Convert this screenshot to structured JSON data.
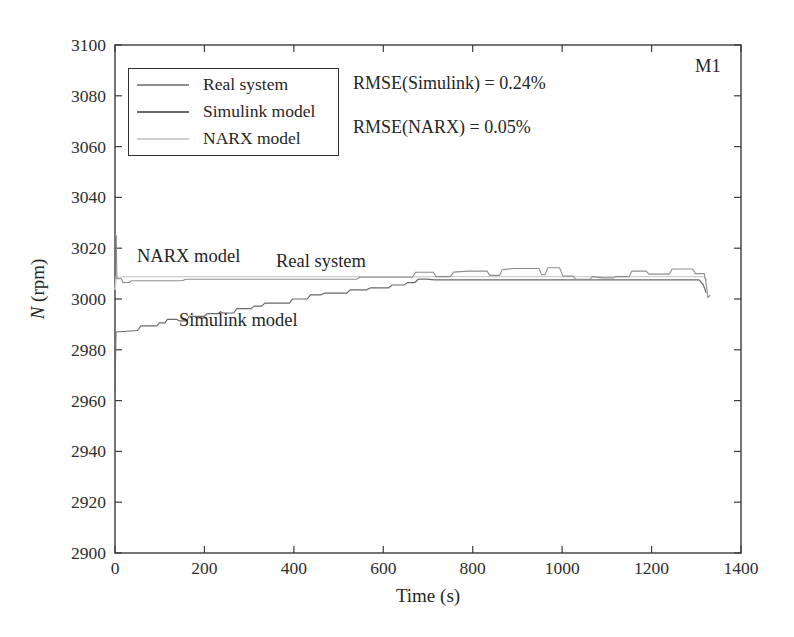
{
  "annotations": {
    "rmse_simulink": "RMSE(Simulink) = 0.24%",
    "rmse_narx": "RMSE(NARX) = 0.05%",
    "corner": "M1",
    "label_narx": "NARX model",
    "label_real": "Real system",
    "label_simulink": "Simulink model"
  },
  "chart_data": {
    "type": "line",
    "title": "",
    "xlabel": "Time (s)",
    "ylabel": "N (rpm)",
    "ylabel_var": "N",
    "ylabel_unit": " (rpm)",
    "xlim": [
      0,
      1400
    ],
    "ylim": [
      2900,
      3100
    ],
    "xticks": [
      0,
      200,
      400,
      600,
      800,
      1000,
      1200,
      1400
    ],
    "yticks": [
      2900,
      2920,
      2940,
      2960,
      2980,
      3000,
      3020,
      3040,
      3060,
      3080,
      3100
    ],
    "grid": false,
    "legend_position": "top-left-inside",
    "axis_color": "#3c3c3c",
    "tick_label_color": "#2e2e2e",
    "series": [
      {
        "name": "Real system",
        "color": "#8e8e8e",
        "width": 1.1,
        "points": [
          [
            0,
            3025
          ],
          [
            3,
            3025
          ],
          [
            4,
            3008
          ],
          [
            14,
            3008
          ],
          [
            18,
            3006.5
          ],
          [
            32,
            3006.5
          ],
          [
            36,
            3007.2
          ],
          [
            150,
            3007.2
          ],
          [
            158,
            3007.8
          ],
          [
            540,
            3007.8
          ],
          [
            548,
            3008.6
          ],
          [
            665,
            3008.6
          ],
          [
            672,
            3010.5
          ],
          [
            712,
            3010.5
          ],
          [
            718,
            3008.8
          ],
          [
            750,
            3008.8
          ],
          [
            757,
            3010.6
          ],
          [
            790,
            3011
          ],
          [
            832,
            3011
          ],
          [
            838,
            3009.3
          ],
          [
            860,
            3009.3
          ],
          [
            866,
            3011.5
          ],
          [
            890,
            3012
          ],
          [
            948,
            3012
          ],
          [
            954,
            3009.6
          ],
          [
            962,
            3009.6
          ],
          [
            968,
            3012.3
          ],
          [
            994,
            3012.3
          ],
          [
            1002,
            3009
          ],
          [
            1024,
            3009
          ],
          [
            1030,
            3007.8
          ],
          [
            1062,
            3007.8
          ],
          [
            1068,
            3008.8
          ],
          [
            1090,
            3008.3
          ],
          [
            1115,
            3008.3
          ],
          [
            1120,
            3008.8
          ],
          [
            1150,
            3008.8
          ],
          [
            1156,
            3011
          ],
          [
            1188,
            3011
          ],
          [
            1194,
            3009.8
          ],
          [
            1240,
            3009.8
          ],
          [
            1246,
            3011.8
          ],
          [
            1292,
            3011.8
          ],
          [
            1298,
            3010
          ],
          [
            1318,
            3010
          ],
          [
            1323,
            3005
          ],
          [
            1326,
            3000.5
          ],
          [
            1331,
            3001.5
          ]
        ]
      },
      {
        "name": "Simulink model",
        "color": "#6a6a6a",
        "width": 1.2,
        "points": [
          [
            0,
            2964
          ],
          [
            2,
            2987
          ],
          [
            50,
            2987.6
          ],
          [
            58,
            2989.4
          ],
          [
            94,
            2989.4
          ],
          [
            99,
            2990.6
          ],
          [
            112,
            2990.6
          ],
          [
            117,
            2992
          ],
          [
            138,
            2992
          ],
          [
            143,
            2991.4
          ],
          [
            160,
            2991.4
          ],
          [
            166,
            2993.2
          ],
          [
            200,
            2993.2
          ],
          [
            206,
            2994.2
          ],
          [
            230,
            2994.2
          ],
          [
            236,
            2995
          ],
          [
            242,
            2994.5
          ],
          [
            266,
            2994.5
          ],
          [
            272,
            2996.2
          ],
          [
            304,
            2996.2
          ],
          [
            311,
            2997.2
          ],
          [
            328,
            2997.2
          ],
          [
            335,
            2998.4
          ],
          [
            390,
            2998.4
          ],
          [
            397,
            3000
          ],
          [
            430,
            3000
          ],
          [
            437,
            3001.6
          ],
          [
            460,
            3001.6
          ],
          [
            468,
            3002.3
          ],
          [
            518,
            3002.3
          ],
          [
            526,
            3003.6
          ],
          [
            562,
            3003.6
          ],
          [
            572,
            3004.4
          ],
          [
            612,
            3004.4
          ],
          [
            620,
            3005.5
          ],
          [
            646,
            3005.5
          ],
          [
            654,
            3006.4
          ],
          [
            670,
            3006.4
          ],
          [
            678,
            3007.8
          ],
          [
            698,
            3007.8
          ],
          [
            714,
            3007.5
          ],
          [
            1306,
            3007.5
          ],
          [
            1316,
            3005.5
          ],
          [
            1322,
            3002.5
          ]
        ]
      },
      {
        "name": "NARX model",
        "color": "#cfcfcf",
        "width": 1.4,
        "points": [
          [
            0,
            3003.5
          ],
          [
            3,
            3009
          ],
          [
            9,
            3008.3
          ],
          [
            16,
            3008.8
          ],
          [
            1318,
            3008.8
          ],
          [
            1324,
            3007.3
          ]
        ]
      }
    ]
  }
}
